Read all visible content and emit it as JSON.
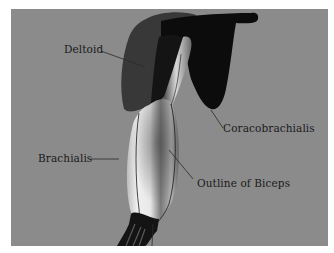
{
  "figure": {
    "background_color": "#8b8b8b",
    "labels": [
      {
        "id": "deltoid",
        "text": "Deltoid"
      },
      {
        "id": "coracobrachialis",
        "text": "Coracobrachialis"
      },
      {
        "id": "brachialis",
        "text": "Brachialis"
      },
      {
        "id": "biceps-outline",
        "text": "Outline of Biceps"
      }
    ],
    "colors": {
      "deltoid": "#3a3a3a",
      "coracobrachialis": "#0d0d0d",
      "biceps_light": "#e6e6e6",
      "biceps_dark": "#555555",
      "leader_line": "#2a2a2a"
    }
  }
}
